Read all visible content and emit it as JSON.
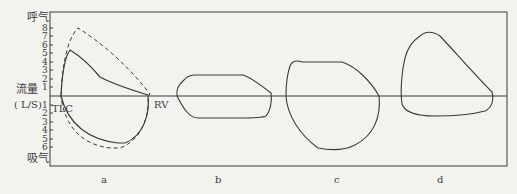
{
  "figure": {
    "y_axis": {
      "title_top": "呼气",
      "title_bottom": "吸气",
      "label_line1": "流量",
      "label_line2": "( L/S)",
      "ticks_up": [
        "8",
        "7",
        "6",
        "5",
        "4",
        "3",
        "2",
        "1"
      ],
      "ticks_down": [
        "1",
        "2",
        "3",
        "4",
        "5",
        "6"
      ]
    },
    "annotations": {
      "tlc": "TLC",
      "rv": "RV"
    },
    "panels": [
      {
        "id": "a",
        "label": "a"
      },
      {
        "id": "b",
        "label": "b"
      },
      {
        "id": "c",
        "label": "c"
      },
      {
        "id": "d",
        "label": "d"
      }
    ],
    "colors": {
      "line": "#3a3a3a",
      "background": "#f2f2ef"
    }
  }
}
